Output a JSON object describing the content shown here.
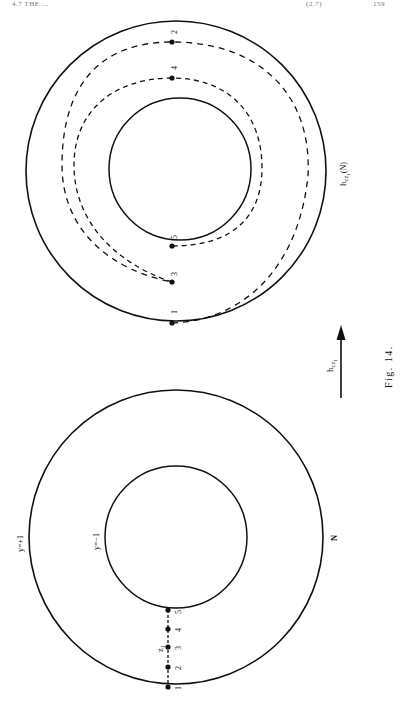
{
  "page": {
    "running_head": {
      "left": "4.7  THE ... ",
      "middle": "(2.7)",
      "page_number": "159"
    },
    "caption": "Fig. 14."
  },
  "figure_right": {
    "outer_label": "h_cz1(N)",
    "outer_label_main": "h",
    "outer_label_sub": "cz",
    "outer_label_subsub": "1",
    "outer_label_suffix": "(N)",
    "points": [
      {
        "label": "1"
      },
      {
        "label": "2"
      },
      {
        "label": "3"
      },
      {
        "label": "4"
      },
      {
        "label": "5"
      }
    ]
  },
  "figure_left": {
    "outer_label": "y=+1",
    "inner_label": "y=−1",
    "region_label": "N",
    "path_label": "z",
    "path_label_sub": "1",
    "points": [
      {
        "label": "1"
      },
      {
        "label": "2"
      },
      {
        "label": "3"
      },
      {
        "label": "4"
      },
      {
        "label": "5"
      }
    ]
  },
  "arrow": {
    "label_main": "h",
    "label_sub": "cz",
    "label_subsub": "1"
  },
  "colors": {
    "ink": "#111111",
    "background": "#ffffff"
  }
}
